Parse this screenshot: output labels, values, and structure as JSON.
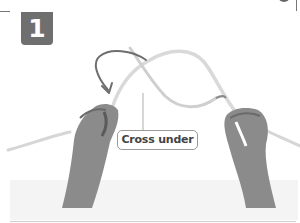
{
  "step": {
    "number": "1",
    "label": "Cross under"
  },
  "illustration": {
    "subject": "hands-holding-rope",
    "rope_color": "#d9d9d9",
    "arrow_color": "#6e6e6e",
    "skin_color": "#8a8a8a"
  },
  "colors": {
    "badge_bg": "#6f6f6f",
    "badge_text": "#ffffff",
    "label_border": "#9a9a9a",
    "label_text": "#444444",
    "frame": "#777777"
  }
}
